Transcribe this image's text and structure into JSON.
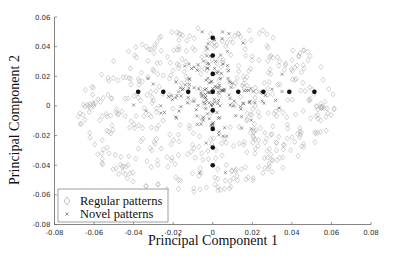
{
  "chart_data": {
    "type": "scatter",
    "title": "",
    "xlabel": "Principal Component 1",
    "ylabel": "Principal Component 2",
    "xlim": [
      -0.08,
      0.08
    ],
    "ylim": [
      -0.08,
      0.06
    ],
    "xticks": [
      -0.08,
      -0.06,
      -0.04,
      -0.02,
      0,
      0.02,
      0.04,
      0.06,
      0.08
    ],
    "xtick_labels": [
      "-0.08",
      "-0.06",
      "-0.04",
      "-0.02",
      "0",
      "0.02",
      "0.04",
      "0.06",
      "0.08"
    ],
    "yticks": [
      -0.08,
      -0.06,
      -0.04,
      -0.02,
      0,
      0.02,
      0.04,
      0.06
    ],
    "ytick_labels": [
      "-0.08",
      "-0.06",
      "-0.04",
      "-0.02",
      "0",
      "0.02",
      "0.04",
      "0.06"
    ],
    "grid": false,
    "legend_position": "lower-left",
    "series": [
      {
        "name": "Regular patterns",
        "marker": "diamond-open",
        "color": "#a8a8a8",
        "distribution": {
          "shape": "ellipse",
          "center": [
            0.0,
            -0.005
          ],
          "x_range": [
            -0.068,
            0.062
          ],
          "y_range": [
            -0.058,
            0.054
          ],
          "count": 520
        }
      },
      {
        "name": "Novel patterns",
        "marker": "x",
        "color": "#555555",
        "distribution": {
          "shape": "cross-cluster",
          "center": [
            0.0,
            0.0095
          ],
          "x_range": [
            -0.04,
            0.035
          ],
          "y_range": [
            -0.045,
            0.05
          ],
          "count": 170
        }
      },
      {
        "name": "Centers",
        "marker": "filled-circle",
        "color": "#111111",
        "in_legend": false,
        "points": [
          [
            -0.0377,
            0.0095
          ],
          [
            -0.025,
            0.0095
          ],
          [
            -0.0124,
            0.0095
          ],
          [
            0.0,
            0.0095
          ],
          [
            0.0129,
            0.0095
          ],
          [
            0.0256,
            0.0095
          ],
          [
            0.0387,
            0.0095
          ],
          [
            0.0514,
            0.0095
          ],
          [
            0.0,
            0.046
          ],
          [
            0.0,
            0.034
          ],
          [
            0.0,
            0.0216
          ],
          [
            0.0,
            -0.003
          ],
          [
            0.0,
            -0.0155
          ],
          [
            0.0,
            -0.028
          ],
          [
            0.0,
            -0.04
          ]
        ]
      }
    ],
    "legend": [
      {
        "label": "Regular patterns",
        "marker": "diamond-open"
      },
      {
        "label": "Novel patterns",
        "marker": "x"
      }
    ]
  }
}
